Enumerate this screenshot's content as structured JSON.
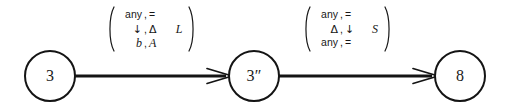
{
  "diagram": {
    "type": "state-transition-diagram",
    "background_color": "#ffffff",
    "stroke_color": "#141414",
    "states": [
      {
        "id": "state-0",
        "label": "3"
      },
      {
        "id": "state-1",
        "label": "3″"
      },
      {
        "id": "state-2",
        "label": "8"
      }
    ],
    "transitions": [
      {
        "id": "edge-0",
        "from": "3",
        "to": "3″",
        "arrowhead": "open-barb",
        "label": {
          "bracket": "parenthesis",
          "rows": [
            {
              "read": "any",
              "sep": ",",
              "write": "=",
              "move": ""
            },
            {
              "read": "↓",
              "sep": ",",
              "write": "Δ",
              "move": "L"
            },
            {
              "read": "b",
              "sep": ",",
              "write": "A",
              "move": ""
            }
          ]
        }
      },
      {
        "id": "edge-1",
        "from": "3″",
        "to": "8",
        "arrowhead": "open-barb",
        "label": {
          "bracket": "parenthesis",
          "rows": [
            {
              "read": "any",
              "sep": ",",
              "write": "=",
              "move": ""
            },
            {
              "read": "Δ",
              "sep": ",",
              "write": "↓",
              "move": "S"
            },
            {
              "read": "any",
              "sep": ",",
              "write": "=",
              "move": ""
            }
          ]
        }
      }
    ]
  }
}
